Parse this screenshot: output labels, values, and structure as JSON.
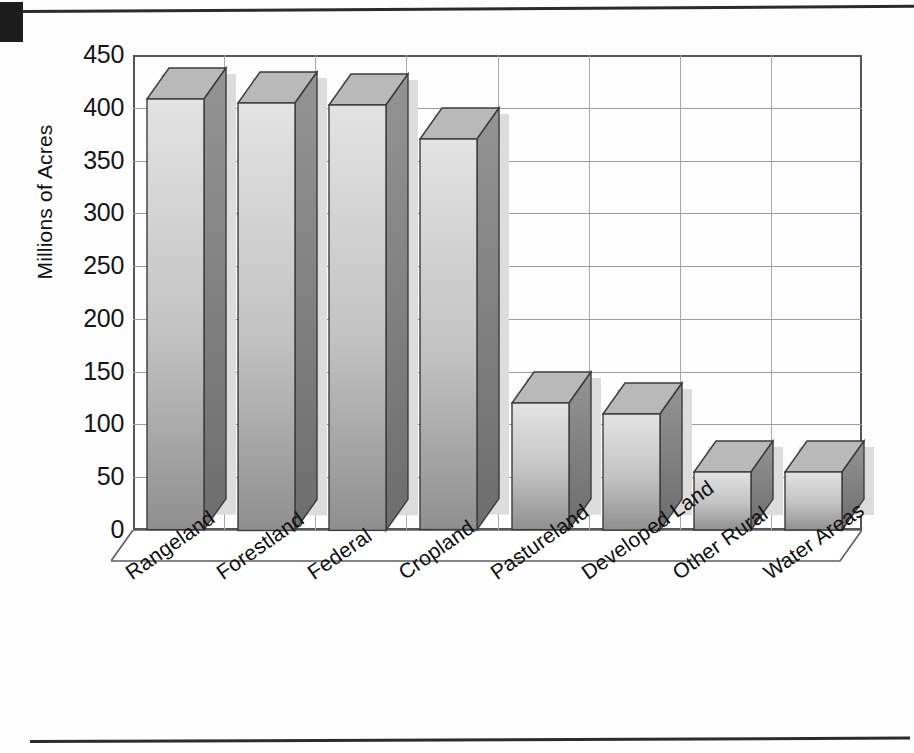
{
  "page": {
    "background_color": "#fdfdfd",
    "artifacts": {
      "corner_mark_label": "scan-corner-mark",
      "top_rule_label": "page-rule-top",
      "bottom_rule_label": "page-rule-bottom"
    }
  },
  "chart_data": {
    "type": "bar",
    "title": "",
    "subtitle": "",
    "xlabel": "",
    "ylabel": "Millions of Acres",
    "ylim": [
      0,
      450
    ],
    "ytick_step": 50,
    "yticks": [
      "0",
      "50",
      "100",
      "150",
      "200",
      "250",
      "300",
      "350",
      "400",
      "450"
    ],
    "grid": true,
    "legend": false,
    "legend_position": "none",
    "three_d": true,
    "categories": [
      "Rangeland",
      "Forestland",
      "Federal",
      "Cropland",
      "Pastureland",
      "Developed Land",
      "Other Rural",
      "Water Areas"
    ],
    "values": [
      408,
      405,
      403,
      370,
      120,
      110,
      55,
      55
    ],
    "series": [
      {
        "name": "Acreage",
        "values": [
          408,
          405,
          403,
          370,
          120,
          110,
          55,
          55
        ]
      }
    ]
  },
  "style": {
    "bar_front_light": "#e3e3e3",
    "bar_front_dark": "#8f8f8f",
    "bar_side": "#777777",
    "bar_top": "#b9b9b9",
    "bar_outline": "#3b3b3b",
    "bar_shadow": "#dcdcdc",
    "grid_color": "#9a9b9f",
    "frame_color": "#55565a",
    "text_color": "#101010"
  }
}
